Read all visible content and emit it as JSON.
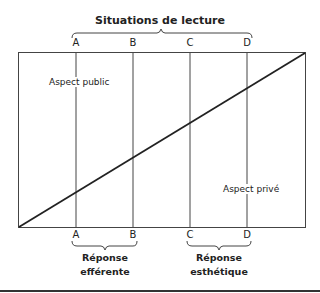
{
  "title": "Situations de lecture",
  "top_labels": [
    "A",
    "B",
    "C",
    "D"
  ],
  "bottom_labels": [
    "A",
    "B",
    "C",
    "D"
  ],
  "aspect_public": "Aspect public",
  "aspect_prive": "Aspect privé",
  "reponse_efferente": [
    "Réponse",
    "efférente"
  ],
  "reponse_esthetique": [
    "Réponse",
    "esthétique"
  ]
}
